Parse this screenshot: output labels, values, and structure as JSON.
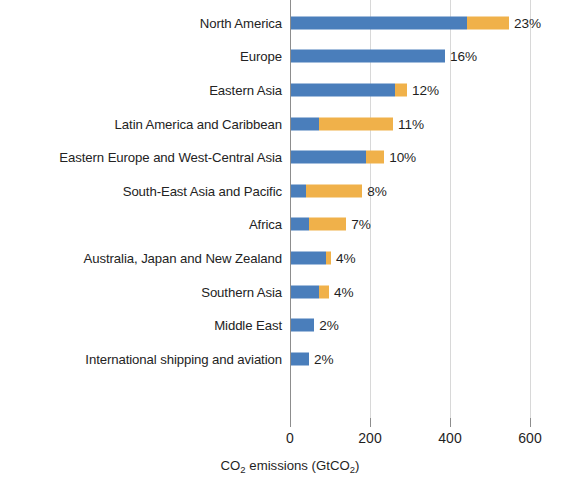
{
  "chart_data": {
    "type": "bar",
    "orientation": "horizontal",
    "stacked": true,
    "title": "",
    "subtitle": "",
    "xlabel": "CO2 emissions (GtCO2)",
    "xlabel_parts": {
      "pre": "CO",
      "sub1": "2",
      "mid": " emissions (GtCO",
      "sub2": "2",
      "post": ")"
    },
    "ylabel": "",
    "xlim": [
      0,
      640
    ],
    "xticks": [
      0,
      200,
      400,
      600
    ],
    "xticklabels": [
      "0",
      "200",
      "400",
      "600"
    ],
    "grid": true,
    "grid_axis": "x",
    "legend": null,
    "colors": {
      "series1": "#4a7ebb",
      "series2": "#f0b14a",
      "grid": "#d8d8d8",
      "axis": "#8d8d8d",
      "text": "#1f1f1f"
    },
    "categories": [
      "North America",
      "Europe",
      "Eastern Asia",
      "Latin America and Caribbean",
      "Eastern Europe and West-Central Asia",
      "South-East Asia and Pacific",
      "Africa",
      "Australia, Japan and New Zealand",
      "Southern Asia",
      "Middle East",
      "International shipping and aviation"
    ],
    "series": [
      {
        "name": "series1",
        "color": "#4a7ebb",
        "values": [
          440,
          385,
          260,
          70,
          188,
          38,
          45,
          88,
          70,
          58,
          45
        ]
      },
      {
        "name": "series2",
        "color": "#f0b14a",
        "values": [
          105,
          0,
          30,
          185,
          45,
          140,
          93,
          12,
          25,
          0,
          0
        ]
      }
    ],
    "totals": [
      545,
      385,
      290,
      255,
      233,
      178,
      138,
      100,
      95,
      58,
      45
    ],
    "data_labels": [
      "23%",
      "16%",
      "12%",
      "11%",
      "10%",
      "8%",
      "7%",
      "4%",
      "4%",
      "2%",
      "2%"
    ]
  }
}
